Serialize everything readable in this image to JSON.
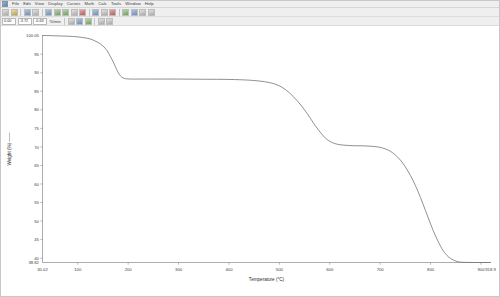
{
  "window": {
    "title": "Universal Analysis",
    "system_icon": "app-icon"
  },
  "menu": {
    "items": [
      {
        "label": "File"
      },
      {
        "label": "Edit"
      },
      {
        "label": "View"
      },
      {
        "label": "Display"
      },
      {
        "label": "Curves"
      },
      {
        "label": "Math"
      },
      {
        "label": "Calc"
      },
      {
        "label": "Tools"
      },
      {
        "label": "Window"
      },
      {
        "label": "Help"
      }
    ]
  },
  "toolbar_primary": {
    "buttons": [
      {
        "name": "new-file-button",
        "icon": "new-document-icon",
        "tone": "grey"
      },
      {
        "name": "open-file-button",
        "icon": "folder-open-icon",
        "tone": "yellow"
      },
      {
        "name": "save-file-button",
        "icon": "floppy-disk-icon",
        "tone": "blue"
      },
      {
        "name": "print-button",
        "icon": "printer-icon",
        "tone": "grey"
      },
      {
        "name": "rescale-button",
        "icon": "rescale-icon",
        "tone": "blue"
      },
      {
        "name": "zoom-in-button",
        "icon": "magnifier-plus-icon",
        "tone": "green"
      },
      {
        "name": "zoom-out-button",
        "icon": "magnifier-minus-icon",
        "tone": "green"
      },
      {
        "name": "cursor-button",
        "icon": "crosshair-icon",
        "tone": "grey"
      },
      {
        "name": "signal-button",
        "icon": "waveform-icon",
        "tone": "red"
      },
      {
        "name": "analyze-button",
        "icon": "analyze-icon",
        "tone": "blue"
      },
      {
        "name": "onset-button",
        "icon": "onset-icon",
        "tone": "grey"
      },
      {
        "name": "peak-button",
        "icon": "peak-icon",
        "tone": "red"
      },
      {
        "name": "integrate-button",
        "icon": "integral-icon",
        "tone": "green"
      },
      {
        "name": "derivative-button",
        "icon": "derivative-icon",
        "tone": "blue"
      },
      {
        "name": "label-button",
        "icon": "text-label-icon",
        "tone": "grey"
      },
      {
        "name": "options-button",
        "icon": "gear-icon",
        "tone": "grey"
      }
    ]
  },
  "toolbar_secondary": {
    "value_field": "0.00",
    "range_field": "-3.72",
    "scale_field": "-0.63",
    "units_label": "%/min",
    "buttons": [
      {
        "name": "linear-fit-button",
        "icon": "line-fit-icon",
        "tone": "grey"
      },
      {
        "name": "smooth-button",
        "icon": "smooth-curve-icon",
        "tone": "blue"
      },
      {
        "name": "baseline-button",
        "icon": "baseline-icon",
        "tone": "green"
      },
      {
        "name": "grid-toggle-button",
        "icon": "grid-icon",
        "tone": "grey"
      },
      {
        "name": "legend-toggle-button",
        "icon": "legend-icon",
        "tone": "grey"
      }
    ]
  },
  "chart_data": {
    "type": "line",
    "title": "",
    "xlabel": "Temperature (°C)",
    "ylabel": "Weight (%)",
    "xlim": [
      30.02,
      918.9
    ],
    "ylim": [
      38.82,
      100.05
    ],
    "grid": false,
    "legend": "none",
    "x_start_label": "30.02",
    "x_end_label": "918.9",
    "y_start_label": "38.82",
    "y_end_label": "100.05",
    "xticks": [
      100,
      200,
      300,
      400,
      500,
      600,
      700,
      800,
      900
    ],
    "xticklabels": [
      "100",
      "200",
      "300",
      "400",
      "500",
      "600",
      "700",
      "800",
      "900"
    ],
    "yticks": [
      95,
      90,
      85,
      80,
      75,
      70,
      65,
      60,
      55,
      50,
      45,
      40
    ],
    "yticklabels": [
      "95",
      "90",
      "85",
      "80",
      "75",
      "70",
      "65",
      "60",
      "55",
      "50",
      "45",
      "40"
    ],
    "series": [
      {
        "name": "TGA weight loss",
        "color": "#6b6b6b",
        "x": [
          30.02,
          50,
          70,
          90,
          110,
          125,
          140,
          150,
          158,
          165,
          170,
          175,
          180,
          185,
          190,
          195,
          205,
          220,
          250,
          300,
          350,
          400,
          440,
          470,
          490,
          505,
          520,
          535,
          550,
          562,
          572,
          582,
          592,
          600,
          610,
          620,
          635,
          650,
          665,
          680,
          695,
          705,
          715,
          725,
          735,
          745,
          755,
          765,
          775,
          785,
          795,
          805,
          815,
          825,
          835,
          845,
          855,
          862,
          870,
          880,
          895,
          918.9
        ],
        "y": [
          100.05,
          100.0,
          99.9,
          99.8,
          99.5,
          99.1,
          98.2,
          97.2,
          96.0,
          94.3,
          93.0,
          91.5,
          90.1,
          89.1,
          88.6,
          88.4,
          88.3,
          88.3,
          88.3,
          88.3,
          88.25,
          88.2,
          88.0,
          87.6,
          87.0,
          86.1,
          84.6,
          82.5,
          80.0,
          77.6,
          75.6,
          73.8,
          72.3,
          71.5,
          70.9,
          70.6,
          70.4,
          70.3,
          70.3,
          70.2,
          70.0,
          69.7,
          69.2,
          68.4,
          67.2,
          65.6,
          63.5,
          61.0,
          58.0,
          54.6,
          51.0,
          47.5,
          44.5,
          42.0,
          40.4,
          39.5,
          39.0,
          38.9,
          38.85,
          38.83,
          38.82,
          38.82
        ]
      }
    ]
  }
}
